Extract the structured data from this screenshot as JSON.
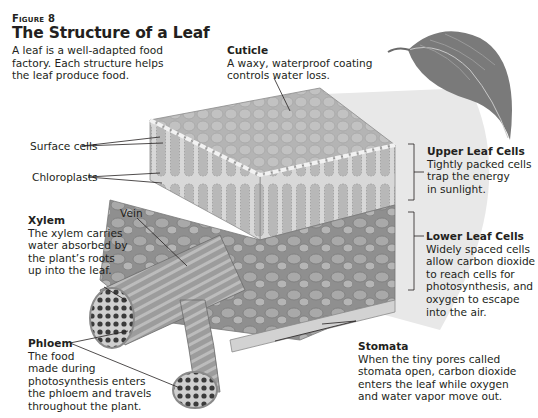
{
  "figure": {
    "number": "Figure 8",
    "title": "The Structure of a Leaf",
    "intro_lines": [
      "A leaf is a well-adapted food",
      "factory. Each structure helps",
      "the leaf produce food."
    ]
  },
  "labels": {
    "cuticle": {
      "title": "Cuticle",
      "lines": [
        "A waxy, waterproof coating",
        "controls water loss."
      ]
    },
    "surface_cells": {
      "title": "Surface cells"
    },
    "chloroplasts": {
      "title": "Chloroplasts"
    },
    "upper_leaf_cells": {
      "title": "Upper Leaf Cells",
      "lines": [
        "Tightly packed cells",
        "trap the energy",
        "in sunlight."
      ]
    },
    "lower_leaf_cells": {
      "title": "Lower Leaf Cells",
      "lines": [
        "Widely spaced cells",
        "allow carbon dioxide",
        "to reach cells for",
        "photosynthesis, and",
        "oxygen to escape",
        "into the air."
      ]
    },
    "vein": {
      "title": "Vein"
    },
    "xylem": {
      "title": "Xylem",
      "lines": [
        "The xylem carries",
        "water absorbed by",
        "the plant’s roots",
        "up into the leaf."
      ]
    },
    "phloem": {
      "title": "Phloem",
      "lines": [
        "The food",
        "made during",
        "photosynthesis enters",
        "the phloem and travels",
        "throughout the plant."
      ]
    },
    "stomata": {
      "title": "Stomata",
      "lines": [
        "When the tiny pores called",
        "stomata open, carbon dioxide",
        "enters the leaf while oxygen",
        "and water vapor move out."
      ]
    }
  },
  "illustration": {
    "subject": "leaf-cross-section",
    "palette": {
      "ink": "#231f20",
      "cell_fill": "#bdbdbd",
      "cell_dark": "#8a8a8a",
      "wedge": "#e6e6e6",
      "leaf": "#7d7d7d"
    }
  }
}
